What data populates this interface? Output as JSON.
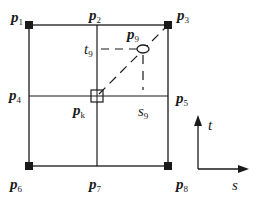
{
  "diagram": {
    "type": "bilinear interpolation grid",
    "points": [
      {
        "id": "p1",
        "base": "p",
        "sub": "1",
        "marker": "filled-square"
      },
      {
        "id": "p2",
        "base": "p",
        "sub": "2",
        "marker": "none"
      },
      {
        "id": "p3",
        "base": "p",
        "sub": "3",
        "marker": "filled-square"
      },
      {
        "id": "p4",
        "base": "p",
        "sub": "4",
        "marker": "none"
      },
      {
        "id": "p5",
        "base": "p",
        "sub": "5",
        "marker": "none"
      },
      {
        "id": "p6",
        "base": "p",
        "sub": "6",
        "marker": "filled-square"
      },
      {
        "id": "p7",
        "base": "p",
        "sub": "7",
        "marker": "none"
      },
      {
        "id": "p8",
        "base": "p",
        "sub": "8",
        "marker": "filled-square"
      },
      {
        "id": "p9",
        "base": "p",
        "sub": "9",
        "marker": "ellipse"
      },
      {
        "id": "pk",
        "base": "p",
        "sub": "k",
        "marker": "hollow-square"
      }
    ],
    "offsets": [
      {
        "id": "t9",
        "base": "t",
        "sub": "9"
      },
      {
        "id": "s9",
        "base": "s",
        "sub": "9"
      }
    ],
    "axes": {
      "vertical": "t",
      "horizontal": "s"
    },
    "colors": {
      "line": "#1a1a1a",
      "background": "#ffffff"
    }
  }
}
